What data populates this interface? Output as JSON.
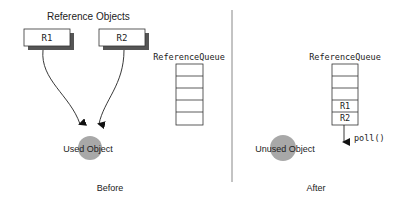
{
  "before": {
    "heading": "Reference Objects",
    "references": [
      {
        "label": "R1"
      },
      {
        "label": "R2"
      }
    ],
    "queue": {
      "title": "ReferenceQueue",
      "slots": [
        "",
        "",
        "",
        "",
        ""
      ]
    },
    "object_label": "Used Object",
    "caption": "Before"
  },
  "after": {
    "queue": {
      "title": "ReferenceQueue",
      "slots": [
        "",
        "",
        "",
        "R1",
        "R2"
      ]
    },
    "poll_label": "poll()",
    "object_label": "Unused Object",
    "caption": "After"
  },
  "colors": {
    "stroke": "#222222",
    "shadow": "#555555",
    "object_fill": "#a8a8a8",
    "divider": "#888888"
  }
}
